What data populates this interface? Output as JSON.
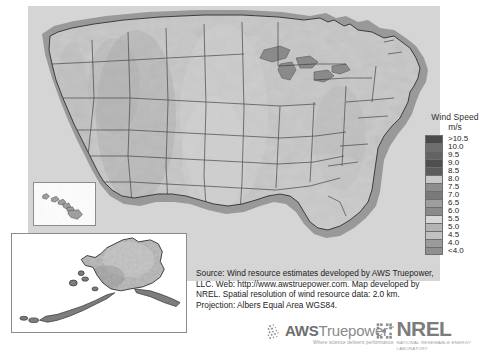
{
  "map": {
    "title": "United States Wind Resource Map",
    "insets": [
      {
        "name": "hawaii-inset",
        "label": "Hawaii"
      },
      {
        "name": "alaska-inset",
        "label": "Alaska"
      }
    ]
  },
  "legend": {
    "title": "Wind Speed",
    "units": "m/s",
    "entries": [
      {
        "label": ">10.5",
        "color": "#4a4a4a"
      },
      {
        "label": "10.0",
        "color": "#6e6e6e"
      },
      {
        "label": "9.5",
        "color": "#636363"
      },
      {
        "label": "9.0",
        "color": "#4f4f4f"
      },
      {
        "label": "8.5",
        "color": "#5c5c5c"
      },
      {
        "label": "8.0",
        "color": "#c9c9c9"
      },
      {
        "label": "7.5",
        "color": "#8d8d8d"
      },
      {
        "label": "7.0",
        "color": "#7a7a7a"
      },
      {
        "label": "6.5",
        "color": "#9e9e9e"
      },
      {
        "label": "6.0",
        "color": "#8a8a8a"
      },
      {
        "label": "5.5",
        "color": "#d7d7d7"
      },
      {
        "label": "5.0",
        "color": "#b3b3b3"
      },
      {
        "label": "4.5",
        "color": "#c2c2c2"
      },
      {
        "label": "4.0",
        "color": "#9b9b9b"
      },
      {
        "label": "<4.0",
        "color": "#8f8f8f"
      }
    ]
  },
  "source": {
    "line1": "Source: Wind resource estimates developed by AWS Truepower,",
    "line2": "LLC. Web: http://www.awstruepower.com. Map developed by",
    "line3": "NREL. Spatial resolution of wind resource data: 2.0 km.",
    "line4": "Projection: Albers Equal Area WGS84."
  },
  "logos": {
    "aws": {
      "name": "AWS Truepower",
      "bold": "AWS",
      "light": "Truepower",
      "tm": "™",
      "tagline": "Where science delivers performance"
    },
    "nrel": {
      "name": "NREL",
      "subtitle": "NATIONAL RENEWABLE ENERGY LABORATORY"
    }
  }
}
